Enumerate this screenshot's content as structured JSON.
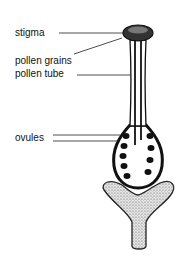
{
  "diagram": {
    "labels": {
      "stigma": "stigma",
      "pollen_grains": "pollen grains",
      "pollen_tube": "pollen tube",
      "ovules": "ovules"
    }
  }
}
